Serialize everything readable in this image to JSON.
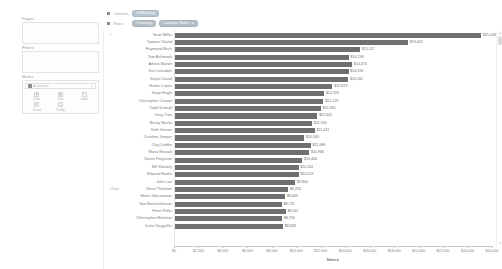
{
  "sidebar": {
    "pages": {
      "label": "Pages"
    },
    "filters": {
      "label": "Filters"
    },
    "marks": {
      "label": "Marks",
      "type_value": "Automatic",
      "type_icon": "bar-mark-icon",
      "caret_icon": "chevron-down-icon",
      "buttons": [
        {
          "label": "Color",
          "icon": "color-icon",
          "glyph": "■"
        },
        {
          "label": "Size",
          "icon": "size-icon",
          "glyph": "▥"
        },
        {
          "label": "Label",
          "icon": "label-icon",
          "glyph": "T"
        },
        {
          "label": "Detail",
          "icon": "detail-icon",
          "glyph": "◎"
        },
        {
          "label": "Tooltip",
          "icon": "tooltip-icon",
          "glyph": "▢"
        }
      ]
    }
  },
  "shelves": {
    "columns": {
      "label": "Columns",
      "icon": "columns-icon",
      "pills": [
        {
          "text": "SUM(Sales)",
          "kind": "measure",
          "sort": ""
        }
      ]
    },
    "rows": {
      "label": "Rows",
      "icon": "rows-icon",
      "pills": [
        {
          "text": "Clustering",
          "kind": "dim",
          "sort": ""
        },
        {
          "text": "Customer Name",
          "kind": "dim",
          "sort": "▲"
        }
      ]
    }
  },
  "view": {
    "row_group_labels": [
      {
        "text": "•",
        "position": "top"
      },
      {
        "text": "Clust",
        "position": "cluster"
      }
    ],
    "scrollbar": {
      "up_icon": "caret-up-icon",
      "down_icon": "caret-down-icon",
      "thumb": "scroll-thumb"
    }
  },
  "chart_data": {
    "type": "bar",
    "orientation": "horizontal",
    "title": "",
    "xlabel": "Sales ▸",
    "ylabel": "",
    "xlim": [
      0,
      26000
    ],
    "xticks": [
      0,
      2000,
      4000,
      6000,
      8000,
      10000,
      12000,
      14000,
      16000,
      18000,
      20000,
      22000,
      24000,
      26000
    ],
    "xtick_labels": [
      "$0",
      "$2,000",
      "$4,000",
      "$6,000",
      "$8,000",
      "$10,000",
      "$12,000",
      "$14,000",
      "$16,000",
      "$18,000",
      "$20,000",
      "$22,000",
      "$24,000",
      "$26,000"
    ],
    "grid": false,
    "legend_position": "none",
    "bar_color": "#6f6f6f",
    "sort": "descending",
    "categories": [
      "Sean Miller",
      "Tamara Chand",
      "Raymond Buch",
      "Tom Ashbrook",
      "Adrian Barton",
      "Ken Lonsdale",
      "Sanjit Chand",
      "Hunter Lopez",
      "Sanjit Engle",
      "Christopher Conant",
      "Todd Sumrall",
      "Greg Tran",
      "Becky Martin",
      "Seth Vernon",
      "Caroline Jumper",
      "Clay Ludtke",
      "Maria Etezadi",
      "Karen Ferguson",
      "Bill Shonely",
      "Edward Hooks",
      "John Lee",
      "Grant Thornton",
      "Helen Wasserman",
      "Tom Boeckenhauer",
      "Peter Fuller",
      "Christopher Martinez",
      "Justin Deggeller"
    ],
    "values": [
      25043,
      19052,
      15117,
      14198,
      14474,
      14190,
      14162,
      12873,
      12209,
      12129,
      11940,
      11641,
      11190,
      11421,
      10565,
      11089,
      10966,
      10406,
      10102,
      10119,
      9800,
      9253,
      9005,
      8731,
      9042,
      8756,
      8828
    ],
    "value_labels": [
      "$25,043",
      "$19,052",
      "$15,117",
      "$14,198",
      "$14,474",
      "$14,190",
      "$14,162",
      "$12,873",
      "$12,209",
      "$12,129",
      "$11,940",
      "$11,641",
      "$11,190",
      "$11,421",
      "$10,565",
      "$11,089",
      "$10,966",
      "$10,406",
      "$10,102",
      "$10,119",
      "$9,800",
      "$9,253",
      "$9,005",
      "$8,731",
      "$9,042",
      "$8,756",
      "$8,828"
    ]
  }
}
